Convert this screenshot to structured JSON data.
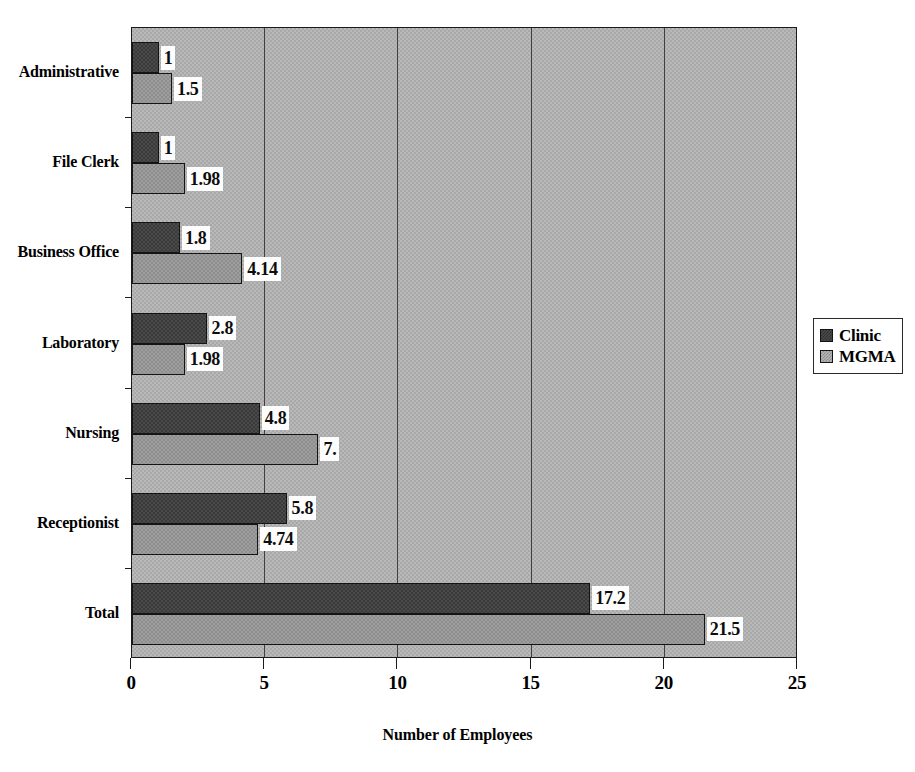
{
  "chart_data": {
    "type": "bar",
    "orientation": "horizontal",
    "title": "",
    "xlabel": "Number of Employees",
    "ylabel": "",
    "xlim": [
      0,
      25
    ],
    "xticks": [
      "0",
      "5",
      "10",
      "15",
      "20",
      "25"
    ],
    "grid": true,
    "legend_position": "right",
    "categories": [
      "Administrative",
      "File Clerk",
      "Business Office",
      "Laboratory",
      "Nursing",
      "Receptionist",
      "Total"
    ],
    "series": [
      {
        "name": "Clinic",
        "color": "#4a4a4a",
        "values": [
          1,
          1,
          1.8,
          2.8,
          4.8,
          5.8,
          17.2
        ],
        "labels": [
          "1",
          "1",
          "1.8",
          "2.8",
          "4.8",
          "5.8",
          "17.2"
        ]
      },
      {
        "name": "MGMA",
        "color": "#9e9e9e",
        "values": [
          1.5,
          1.98,
          4.14,
          1.98,
          7.0,
          4.74,
          21.5
        ],
        "labels": [
          "1.5",
          "1.98",
          "4.14",
          "1.98",
          "7.",
          "4.74",
          "21.5"
        ]
      }
    ]
  },
  "legend": {
    "entries": [
      {
        "label": "Clinic",
        "swatch": "clinic-swatch-icon"
      },
      {
        "label": "MGMA",
        "swatch": "mgma-swatch-icon"
      }
    ]
  },
  "axes": {
    "x_title": "Number of Employees"
  }
}
